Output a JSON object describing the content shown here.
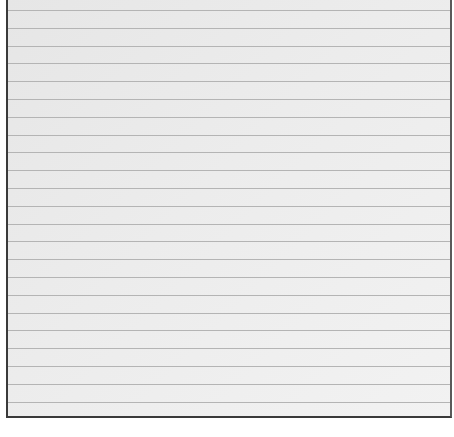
{
  "image": {
    "description": "Blank sheet of lined paper",
    "paper_color": "#ececec",
    "line_color": "#b4b4b4",
    "border_color": "#3a3a3a",
    "line_count": 23,
    "first_line_y": 10,
    "line_spacing": 17.8
  }
}
